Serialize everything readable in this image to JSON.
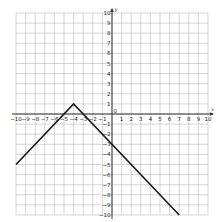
{
  "chart_data": {
    "type": "line",
    "title": "",
    "xlabel": "x",
    "ylabel": "y",
    "xlim": [
      -10,
      10
    ],
    "ylim": [
      -10,
      10
    ],
    "grid": true,
    "legend": null,
    "x_ticks": [
      -10,
      -9,
      -8,
      -7,
      -6,
      -5,
      -4,
      -3,
      -2,
      -1,
      1,
      2,
      3,
      4,
      5,
      6,
      7,
      8,
      9,
      10
    ],
    "y_ticks": [
      -10,
      -9,
      -8,
      -7,
      -6,
      -5,
      -4,
      -3,
      -2,
      -1,
      1,
      2,
      3,
      4,
      5,
      6,
      7,
      8,
      9,
      10
    ],
    "origin_label": "0",
    "series": [
      {
        "name": "y = -|x + 4| + 1",
        "x": [
          -10,
          -4,
          7
        ],
        "y": [
          -5,
          1,
          -10
        ],
        "color": "#1a1a1a"
      }
    ],
    "annotations": []
  },
  "colors": {
    "grid": "#b8b8b8",
    "axis": "#333333",
    "line": "#1a1a1a"
  }
}
